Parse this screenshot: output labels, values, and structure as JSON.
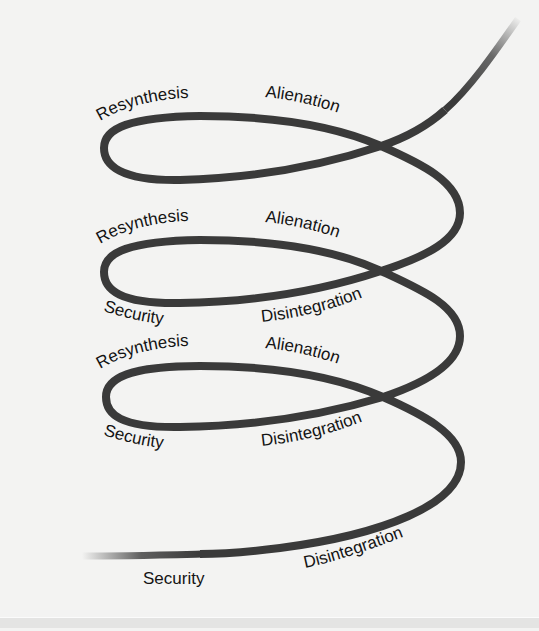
{
  "diagram": {
    "type": "spiral",
    "stroke_color": "#3a3a3a",
    "background_color": "#f3f3f2",
    "text_color": "#141414",
    "loops": [
      {
        "index": 1,
        "labels": {
          "top_left": "Resynthesis",
          "top_right": "Alienation"
        }
      },
      {
        "index": 2,
        "labels": {
          "top_left": "Resynthesis",
          "top_right": "Alienation",
          "bottom_left": "Security",
          "bottom_right": "Disintegration"
        }
      },
      {
        "index": 3,
        "labels": {
          "top_left": "Resynthesis",
          "top_right": "Alienation",
          "bottom_left": "Security",
          "bottom_right": "Disintegration"
        }
      },
      {
        "index": 4,
        "labels": {
          "bottom_left": "Security",
          "bottom_right": "Disintegration"
        }
      }
    ]
  }
}
